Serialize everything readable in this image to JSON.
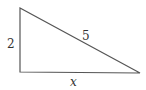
{
  "diagram": {
    "type": "right-triangle",
    "vertices": {
      "top": [
        20,
        8
      ],
      "right_angle": [
        20,
        72
      ],
      "right": [
        140,
        73
      ]
    },
    "labels": {
      "vertical_leg": "2",
      "hypotenuse": "5",
      "horizontal_leg": "x"
    },
    "stroke_color": "#555555",
    "label_color": "#333333"
  }
}
